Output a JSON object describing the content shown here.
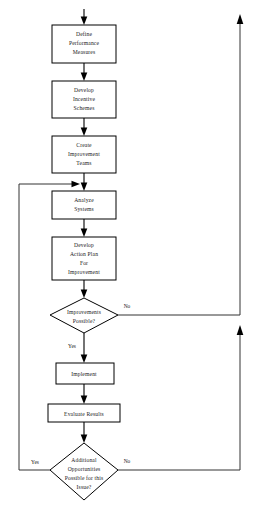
{
  "diagram": {
    "type": "flowchart",
    "background_color": "#ffffff",
    "line_color": "#000000",
    "text_color": "#1a1a1a",
    "nodes": [
      {
        "id": "define-performance-measures",
        "shape": "process",
        "lines": [
          "Define",
          "Performance",
          "Measures"
        ]
      },
      {
        "id": "develop-incentive-schemes",
        "shape": "process",
        "lines": [
          "Develop",
          "Incentive",
          "Schemes"
        ]
      },
      {
        "id": "create-improvement-teams",
        "shape": "process",
        "lines": [
          "Create",
          "Improvement",
          "Teams"
        ]
      },
      {
        "id": "analyze-systems",
        "shape": "process",
        "lines": [
          "Analyze",
          "Systems"
        ]
      },
      {
        "id": "develop-action-plan",
        "shape": "process",
        "lines": [
          "Develop",
          "Action Plan",
          "For",
          "Improvement"
        ]
      },
      {
        "id": "improvements-possible",
        "shape": "decision",
        "lines": [
          "Improvements",
          "Possible?"
        ]
      },
      {
        "id": "implement",
        "shape": "process",
        "lines": [
          "Implement"
        ]
      },
      {
        "id": "evaluate-results",
        "shape": "process",
        "lines": [
          "Evaluate Results"
        ]
      },
      {
        "id": "additional-opportunities",
        "shape": "decision",
        "lines": [
          "Additional",
          "Opportunities",
          "Possible for this",
          "Issue?"
        ]
      }
    ],
    "edge_labels": {
      "improvements_no": "No",
      "improvements_yes": "Yes",
      "additional_yes": "Yes",
      "additional_no": "No"
    }
  }
}
